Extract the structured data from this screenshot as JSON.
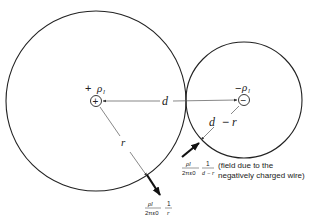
{
  "diagram": {
    "type": "physics-field-diagram",
    "colors": {
      "line": "#222222",
      "thin_line": "#555555",
      "background": "#ffffff"
    },
    "charges": {
      "positive": {
        "label": "+ ρl",
        "sign": "+",
        "symbol": "ρ",
        "subscript": "l",
        "center": [
          96,
          101
        ]
      },
      "negative": {
        "label": "−ρl",
        "sign": "−",
        "symbol": "ρ",
        "subscript": "l",
        "center": [
          244,
          100
        ]
      }
    },
    "circles": {
      "large": {
        "center": [
          96,
          101
        ],
        "radius": 90
      },
      "small": {
        "center": [
          244,
          100
        ],
        "radius": 58
      }
    },
    "distances": {
      "d": "d",
      "r": "r",
      "d_minus_r": {
        "d": "d",
        "minus": "−",
        "r": "r"
      }
    },
    "field_positive": {
      "numerator": "ρl",
      "denominator": "2πε0",
      "frac2_num": "1",
      "frac2_den": "r"
    },
    "field_negative": {
      "numerator": "ρl",
      "denominator": "2πε0",
      "frac2_num": "1",
      "frac2_den": "d − r",
      "note_line1": "(field due to the",
      "note_line2": "negatively charged wire)"
    }
  }
}
